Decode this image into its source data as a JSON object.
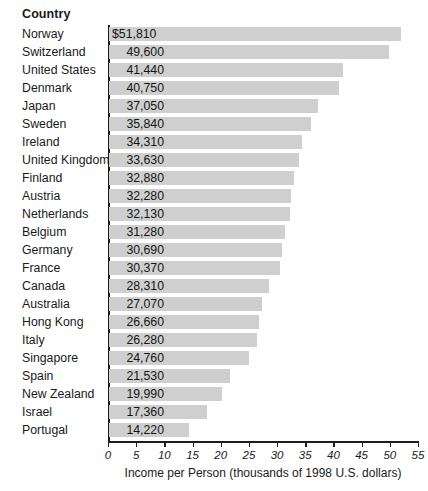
{
  "header": {
    "column_title": "Country"
  },
  "chart_data": {
    "type": "bar",
    "orientation": "horizontal",
    "title": "",
    "subtitle": "",
    "xlabel": "Income per Person (thousands of 1998 U.S. dollars)",
    "ylabel": "Country",
    "xlim": [
      0,
      55
    ],
    "xticks": [
      0,
      5,
      10,
      15,
      20,
      25,
      30,
      35,
      40,
      45,
      50,
      55
    ],
    "xtick_labels": [
      "0",
      "5",
      "10",
      "15",
      "20",
      "25",
      "30",
      "35",
      "40",
      "45",
      "50",
      "55"
    ],
    "grid": false,
    "legend": false,
    "bar_color": "#cfcfcf",
    "axis_color": "#1c1c1c",
    "units": "thousands of 1998 U.S. dollars",
    "categories": [
      "Norway",
      "Switzerland",
      "United States",
      "Denmark",
      "Japan",
      "Sweden",
      "Ireland",
      "United Kingdom",
      "Finland",
      "Austria",
      "Netherlands",
      "Belgium",
      "Germany",
      "France",
      "Canada",
      "Australia",
      "Hong Kong",
      "Italy",
      "Singapore",
      "Spain",
      "New Zealand",
      "Israel",
      "Portugal"
    ],
    "values": [
      51.81,
      49.6,
      41.44,
      40.75,
      37.05,
      35.84,
      34.31,
      33.63,
      32.88,
      32.28,
      32.13,
      31.28,
      30.69,
      30.37,
      28.31,
      27.07,
      26.66,
      26.28,
      24.76,
      21.53,
      19.99,
      17.36,
      14.22
    ],
    "value_labels": [
      "$51,810",
      "49,600",
      "41,440",
      "40,750",
      "37,050",
      "35,840",
      "34,310",
      "33,630",
      "32,880",
      "32,280",
      "32,130",
      "31,280",
      "30,690",
      "30,370",
      "28,310",
      "27,070",
      "26,660",
      "26,280",
      "24,760",
      "21,530",
      "19,990",
      "17,360",
      "14,220"
    ]
  }
}
